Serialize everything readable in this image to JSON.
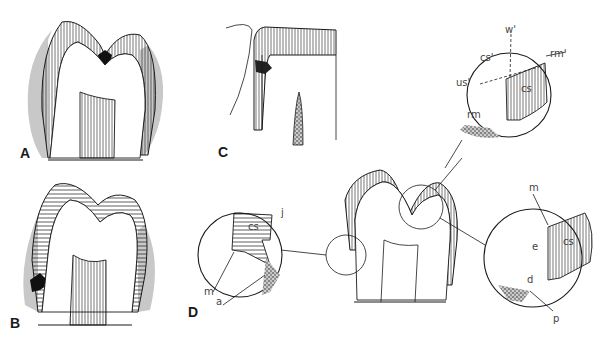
{
  "figure": {
    "colors": {
      "ink": "#1a1a1a",
      "plaque_gray": "#c8c8c8",
      "background": "#ffffff",
      "label_gray": "#444444"
    },
    "panels": [
      {
        "id": "A",
        "label": "A",
        "subject": "molar section with fissure lesion"
      },
      {
        "id": "B",
        "label": "B",
        "subject": "molar section with smooth-surface lesion"
      },
      {
        "id": "C",
        "label": "C",
        "subject": "crown section with cervical lesion"
      },
      {
        "id": "D",
        "label": "D",
        "subject": "molar with three magnified circular insets"
      }
    ],
    "insets": {
      "left": {
        "labels": {
          "cs": "cs",
          "j": "j",
          "m": "m",
          "a": "a"
        }
      },
      "top_right": {
        "labels": {
          "w": "w'",
          "rm_prime": "rm'",
          "cs_prime": "cs'",
          "us_prime": "us'",
          "cs": "cs",
          "rm": "rm"
        }
      },
      "bottom_right": {
        "labels": {
          "m": "m",
          "e": "e",
          "cs": "cs",
          "d": "d",
          "p": "p"
        }
      }
    }
  }
}
